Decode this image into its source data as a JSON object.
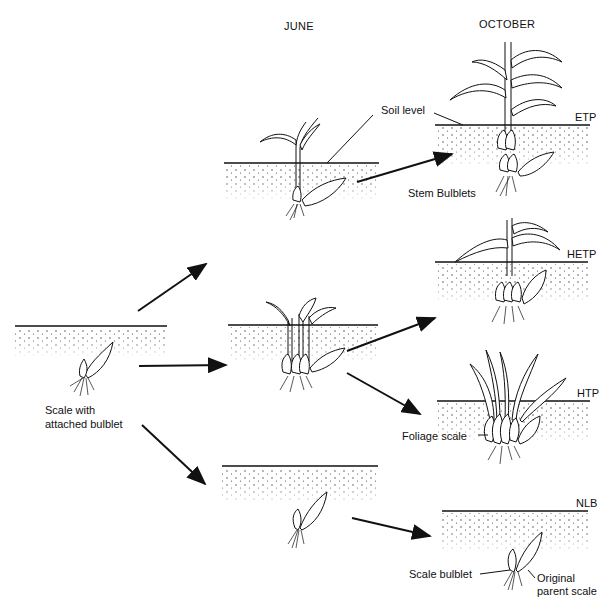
{
  "headers": {
    "june": "JUNE",
    "october": "OCTOBER"
  },
  "labels": {
    "scale_with": "Scale with",
    "attached_bulblet": "attached bulblet",
    "soil_level": "Soil level",
    "stem_bulblets": "Stem Bulblets",
    "foliage_scale": "Foliage scale",
    "scale_bulblet": "Scale bulblet",
    "original": "Original",
    "parent_scale": "parent scale"
  },
  "outcomes": {
    "etp": "ETP",
    "hetp": "HETP",
    "htp": "HTP",
    "nlb": "NLB"
  },
  "colors": {
    "ink": "#111111",
    "background": "#ffffff"
  }
}
